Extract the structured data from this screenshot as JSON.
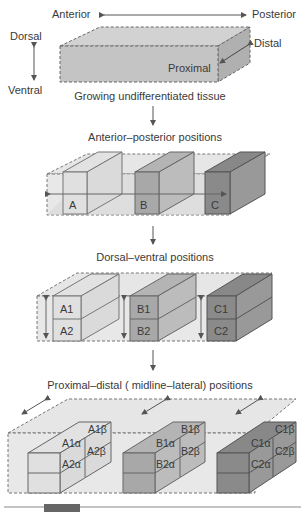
{
  "orientation": {
    "anterior": "Anterior",
    "posterior": "Posterior",
    "dorsal": "Dorsal",
    "ventral": "Ventral",
    "distal": "Distal",
    "proximal": "Proximal"
  },
  "stages": [
    {
      "caption": "Growing undifferentiated tissue"
    },
    {
      "caption": "Anterior–posterior positions",
      "boxes": [
        "A",
        "B",
        "C"
      ]
    },
    {
      "caption": "Dorsal–ventral positions",
      "boxes": [
        [
          "A1",
          "A2"
        ],
        [
          "B1",
          "B2"
        ],
        [
          "C1",
          "C2"
        ]
      ]
    },
    {
      "caption": "Proximal–distal ( midline–lateral) positions",
      "boxes": [
        {
          "front": [
            "A1α",
            "A2α"
          ],
          "side": [
            "A1β",
            "A2β"
          ]
        },
        {
          "front": [
            "B1α",
            "B2α"
          ],
          "side": [
            "B1β",
            "B2β"
          ]
        },
        {
          "front": [
            "C1α",
            "C2α"
          ],
          "side": [
            "C1β",
            "C2β"
          ]
        }
      ]
    }
  ],
  "colors": {
    "tissue": "#c9c9c9",
    "light": "#e4e4e4",
    "A": "#dcdcdc",
    "B": "#a9a9a9",
    "C": "#8a8a8a",
    "line": "#555555"
  }
}
